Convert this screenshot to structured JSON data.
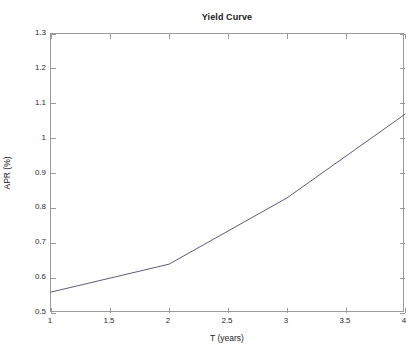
{
  "chart_data": {
    "type": "line",
    "title": "Yield Curve",
    "xlabel": "T (years)",
    "ylabel": "APR (%)",
    "xlim": [
      1,
      4
    ],
    "ylim": [
      0.5,
      1.3
    ],
    "xticks": [
      1,
      1.5,
      2,
      2.5,
      3,
      3.5,
      4
    ],
    "xtick_labels": [
      "1",
      "1.5",
      "2",
      "2.5",
      "3",
      "3.5",
      "4"
    ],
    "yticks": [
      0.5,
      0.6,
      0.7,
      0.8,
      0.9,
      1.0,
      1.1,
      1.2,
      1.3
    ],
    "ytick_labels": [
      "0.5",
      "0.6",
      "0.7",
      "0.8",
      "0.9",
      "1",
      "1.1",
      "1.2",
      "1.3"
    ],
    "grid": false,
    "legend": null,
    "series": [
      {
        "name": "Yield",
        "color": "#4a4a6a",
        "x": [
          1,
          2,
          3,
          4
        ],
        "values": [
          0.56,
          0.64,
          0.83,
          1.07
        ]
      }
    ]
  },
  "figure": {
    "background_color": "#ffffff",
    "axes_color": "#9a9a9a",
    "text_color": "#1a1a1a"
  }
}
